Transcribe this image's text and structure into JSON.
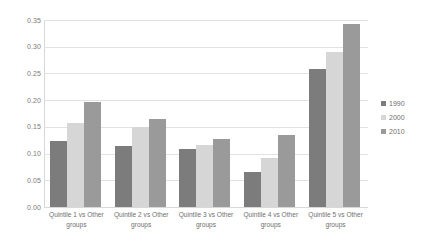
{
  "chart_data": {
    "type": "bar",
    "title": "",
    "subtitle": "",
    "xlabel": "",
    "ylabel": "",
    "ylim": [
      0.0,
      0.35
    ],
    "y_ticks": [
      "0.00",
      "0.05",
      "0.10",
      "0.15",
      "0.20",
      "0.25",
      "0.30",
      "0.35"
    ],
    "y_tick_values": [
      0.0,
      0.05,
      0.1,
      0.15,
      0.2,
      0.25,
      0.3,
      0.35
    ],
    "grid": true,
    "legend_position": "right",
    "categories": [
      "Quintile 1 vs Other groups",
      "Quintile 2 vs Other groups",
      "Quintile 3 vs Other groups",
      "Quintile 4 vs Other groups",
      "Quintile 5 vs Other groups"
    ],
    "series": [
      {
        "name": "1990",
        "color": "#7c7c7c",
        "values": [
          0.123,
          0.115,
          0.109,
          0.066,
          0.259
        ]
      },
      {
        "name": "2000",
        "color": "#d6d6d6",
        "values": [
          0.158,
          0.15,
          0.116,
          0.091,
          0.29
        ]
      },
      {
        "name": "2010",
        "color": "#9a9a9a",
        "values": [
          0.196,
          0.165,
          0.128,
          0.135,
          0.343
        ]
      }
    ]
  },
  "colors": {
    "background": "#ffffff",
    "gridline": "#e2e2e2",
    "axis": "#d8d8d8",
    "text": "#6f6f6f"
  }
}
